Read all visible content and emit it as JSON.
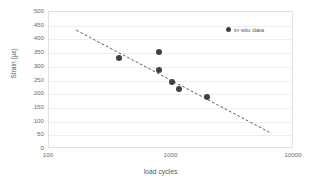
{
  "chart_data": {
    "type": "scatter",
    "title": "",
    "xlabel": "load cycles",
    "ylabel": "Strain (µε)",
    "xscale": "log",
    "yscale": "linear",
    "xlim": [
      100,
      10000
    ],
    "ylim": [
      0,
      500
    ],
    "xticks": [
      "100",
      "1000",
      "10000"
    ],
    "xtick_values": [
      100,
      1000,
      10000
    ],
    "yticks": [
      "0",
      "50",
      "100",
      "150",
      "200",
      "250",
      "300",
      "350",
      "400",
      "450",
      "500"
    ],
    "ytick_values": [
      0,
      50,
      100,
      150,
      200,
      250,
      300,
      350,
      400,
      450,
      500
    ],
    "grid": true,
    "grid_axis": "y",
    "legend_position": "top-right",
    "series": [
      {
        "name": "in-situ data",
        "marker": "circle",
        "color": "#404040",
        "points": [
          {
            "x": 370,
            "y": 333
          },
          {
            "x": 790,
            "y": 355
          },
          {
            "x": 790,
            "y": 290
          },
          {
            "x": 1010,
            "y": 245
          },
          {
            "x": 1160,
            "y": 220
          },
          {
            "x": 1950,
            "y": 190
          }
        ]
      }
    ],
    "trendline": {
      "style": "dashed",
      "color": "#595959",
      "x_start": 170,
      "y_start": 430,
      "x_end": 6700,
      "y_end": 53
    }
  },
  "legend": {
    "marker_icon": "filled-circle-marker",
    "label": "in-situ data"
  },
  "axes": {
    "x_title": "load cycles",
    "y_title": "Strain (µε)"
  },
  "colors": {
    "marker": "#404040",
    "trendline": "#595959",
    "gridline": "#eeeeee",
    "frame": "#e2e2e2",
    "tick_text": "#6d6d6d",
    "axis_title": "#595959",
    "background": "#ffffff"
  }
}
